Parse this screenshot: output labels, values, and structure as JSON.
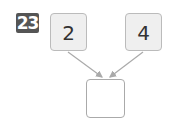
{
  "problem": {
    "number": "23",
    "left_value": "2",
    "right_value": "4",
    "answer_value": ""
  },
  "colors": {
    "badge_bg": "#555555",
    "box_bg": "#efefef",
    "arrow": "#aaaaaa"
  }
}
